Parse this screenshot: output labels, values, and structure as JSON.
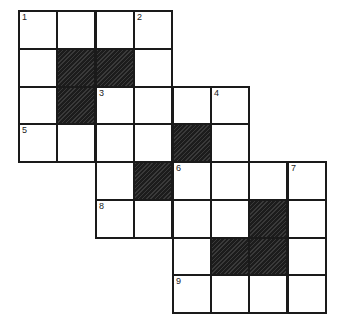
{
  "puzzle": {
    "type": "crossword",
    "rows": 8,
    "cols": 8,
    "origin": {
      "x": 19,
      "y": 11
    },
    "cell_w": 38.4,
    "cell_h": 37.75,
    "colors": {
      "line": "#1a1a1a",
      "white": "#ffffff",
      "black": "#2a2a2a"
    },
    "cells": [
      {
        "r": 0,
        "c": 0,
        "type": "white",
        "num": "1"
      },
      {
        "r": 0,
        "c": 1,
        "type": "white"
      },
      {
        "r": 0,
        "c": 2,
        "type": "white"
      },
      {
        "r": 0,
        "c": 3,
        "type": "white",
        "num": "2"
      },
      {
        "r": 1,
        "c": 0,
        "type": "white"
      },
      {
        "r": 1,
        "c": 1,
        "type": "black"
      },
      {
        "r": 1,
        "c": 2,
        "type": "black"
      },
      {
        "r": 1,
        "c": 3,
        "type": "white"
      },
      {
        "r": 2,
        "c": 0,
        "type": "white"
      },
      {
        "r": 2,
        "c": 1,
        "type": "black"
      },
      {
        "r": 2,
        "c": 2,
        "type": "white",
        "num": "3"
      },
      {
        "r": 2,
        "c": 3,
        "type": "white"
      },
      {
        "r": 2,
        "c": 4,
        "type": "white"
      },
      {
        "r": 2,
        "c": 5,
        "type": "white",
        "num": "4"
      },
      {
        "r": 3,
        "c": 0,
        "type": "white",
        "num": "5"
      },
      {
        "r": 3,
        "c": 1,
        "type": "white"
      },
      {
        "r": 3,
        "c": 2,
        "type": "white"
      },
      {
        "r": 3,
        "c": 3,
        "type": "white"
      },
      {
        "r": 3,
        "c": 4,
        "type": "black"
      },
      {
        "r": 3,
        "c": 5,
        "type": "white"
      },
      {
        "r": 4,
        "c": 2,
        "type": "white"
      },
      {
        "r": 4,
        "c": 3,
        "type": "black"
      },
      {
        "r": 4,
        "c": 4,
        "type": "white",
        "num": "6"
      },
      {
        "r": 4,
        "c": 5,
        "type": "white"
      },
      {
        "r": 4,
        "c": 6,
        "type": "white"
      },
      {
        "r": 4,
        "c": 7,
        "type": "white",
        "num": "7"
      },
      {
        "r": 5,
        "c": 2,
        "type": "white",
        "num": "8"
      },
      {
        "r": 5,
        "c": 3,
        "type": "white"
      },
      {
        "r": 5,
        "c": 4,
        "type": "white"
      },
      {
        "r": 5,
        "c": 5,
        "type": "white"
      },
      {
        "r": 5,
        "c": 6,
        "type": "black"
      },
      {
        "r": 5,
        "c": 7,
        "type": "white"
      },
      {
        "r": 6,
        "c": 4,
        "type": "white"
      },
      {
        "r": 6,
        "c": 5,
        "type": "black"
      },
      {
        "r": 6,
        "c": 6,
        "type": "black"
      },
      {
        "r": 6,
        "c": 7,
        "type": "white"
      },
      {
        "r": 7,
        "c": 4,
        "type": "white",
        "num": "9"
      },
      {
        "r": 7,
        "c": 5,
        "type": "white"
      },
      {
        "r": 7,
        "c": 6,
        "type": "white"
      },
      {
        "r": 7,
        "c": 7,
        "type": "white"
      }
    ]
  }
}
